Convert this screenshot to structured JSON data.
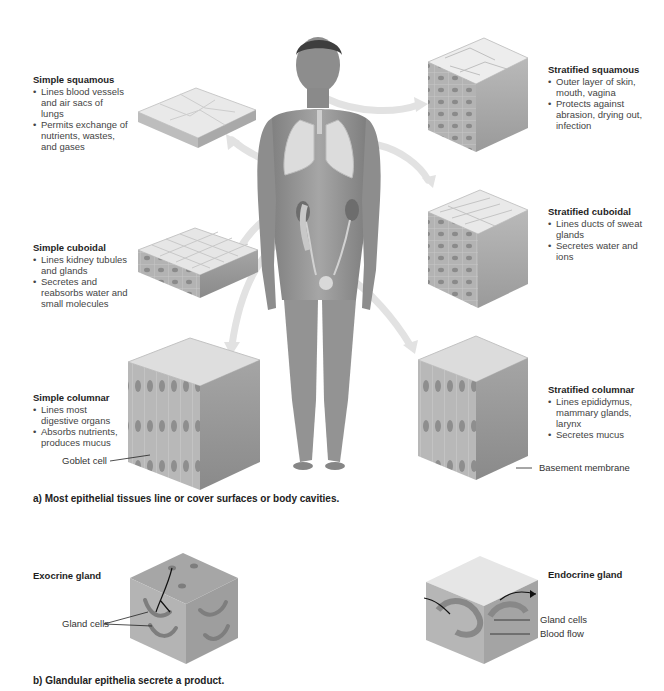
{
  "figure": {
    "panel_a": {
      "caption": "a) Most epithelial tissues line or cover surfaces or body cavities.",
      "tissues": [
        {
          "name": "Simple squamous",
          "bullets": [
            "Lines blood vessels and air sacs of lungs",
            "Permits exchange of nutrients, wastes, and gases"
          ]
        },
        {
          "name": "Simple cuboidal",
          "bullets": [
            "Lines kidney tubules and glands",
            "Secretes and reabsorbs water and small molecules"
          ]
        },
        {
          "name": "Simple columnar",
          "bullets": [
            "Lines most digestive organs",
            "Absorbs nutrients, produces mucus"
          ],
          "callout": "Goblet cell"
        },
        {
          "name": "Stratified squamous",
          "bullets": [
            "Outer layer of skin, mouth, vagina",
            "Protects against abrasion, drying out, infection"
          ]
        },
        {
          "name": "Stratified cuboidal",
          "bullets": [
            "Lines ducts of sweat glands",
            "Secretes water and ions"
          ]
        },
        {
          "name": "Stratified columnar",
          "bullets": [
            "Lines epididymus, mammary glands, larynx",
            "Secretes mucus"
          ],
          "callout": "Basement membrane"
        }
      ]
    },
    "panel_b": {
      "caption": "b) Glandular epithelia secrete a product.",
      "exocrine": {
        "name": "Exocrine gland",
        "callouts": [
          "Gland cells"
        ]
      },
      "endocrine": {
        "name": "Endocrine gland",
        "callouts": [
          "Gland cells",
          "Blood flow"
        ]
      }
    },
    "colors": {
      "background": "#ffffff",
      "text": "#2a2a2a",
      "arrow": "#e2e2e2",
      "tissue_light": "#e8e8e8",
      "tissue_dark": "#8c8c8c",
      "skin": "#9a9a9a"
    }
  }
}
